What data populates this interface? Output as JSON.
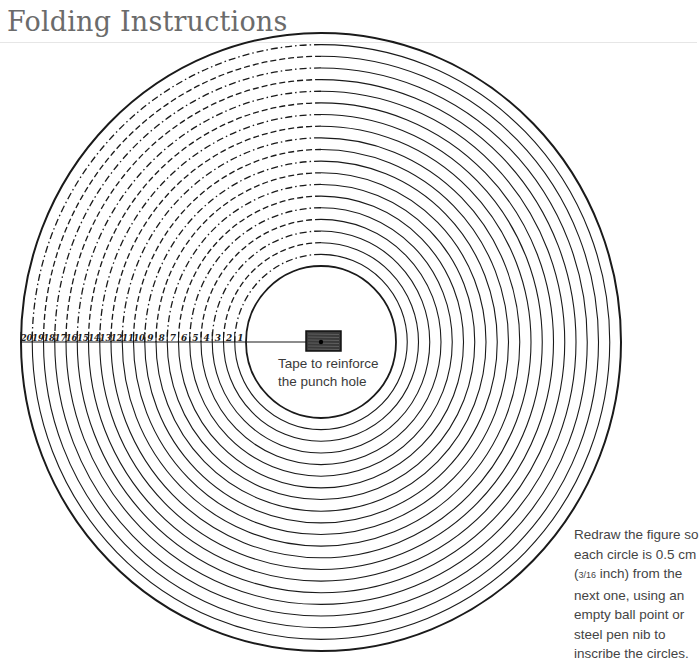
{
  "header": {
    "title": "Folding Instructions"
  },
  "figure": {
    "center": {
      "x": 321,
      "y": 342
    },
    "inner_circle": {
      "rx": 75,
      "ry": 76
    },
    "outer_circle": {
      "rx": 300,
      "ry": 309
    },
    "ring_count": 20,
    "scale_labels": [
      "20",
      "19",
      "18",
      "17",
      "16",
      "15",
      "14",
      "13",
      "12",
      "11",
      "10",
      "9",
      "8",
      "7",
      "6",
      "5",
      "4",
      "3",
      "2",
      "1"
    ],
    "tape_label_line1": "Tape to reinforce",
    "tape_label_line2": "the punch hole",
    "line_color": "#1a1a1a",
    "tape_color": "#3a3a3a"
  },
  "note": {
    "line1": "Redraw the figure so",
    "line2": "each circle is 0.5 cm",
    "line3_frac": "3/16",
    "line3_rest": " inch) from the",
    "line3_open": "(",
    "line4": "next one, using an",
    "line5": "empty ball point or",
    "line6": "steel pen nib to",
    "line7": "inscribe the circles."
  }
}
